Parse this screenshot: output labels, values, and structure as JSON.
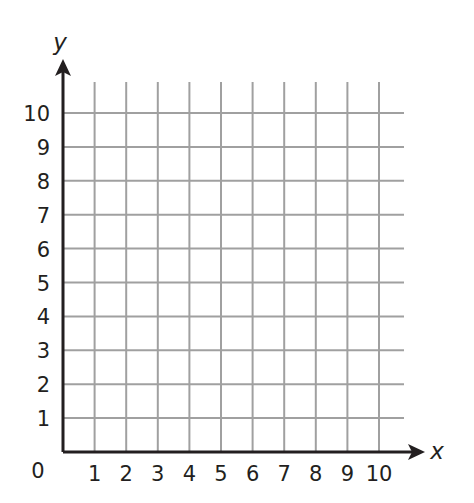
{
  "chart_data": {
    "type": "scatter",
    "title": "",
    "xlabel": "x",
    "ylabel": "y",
    "xlim": [
      0,
      10
    ],
    "ylim": [
      0,
      10
    ],
    "x_ticks": [
      1,
      2,
      3,
      4,
      5,
      6,
      7,
      8,
      9,
      10
    ],
    "y_ticks": [
      1,
      2,
      3,
      4,
      5,
      6,
      7,
      8,
      9,
      10
    ],
    "origin_label": "0",
    "grid": true,
    "series": [],
    "legend": null
  },
  "style": {
    "axis_color": "#231f20",
    "grid_color": "#a0a0a0",
    "background": "#ffffff"
  }
}
